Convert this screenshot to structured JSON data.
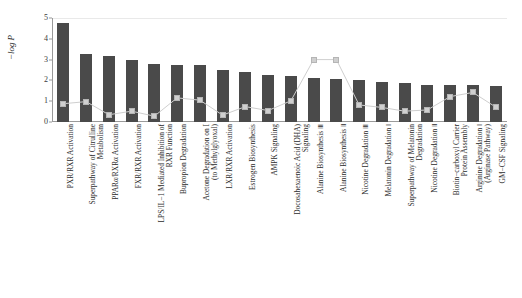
{
  "chart_data": {
    "type": "bar",
    "title": "",
    "xlabel": "",
    "ylabel": "−log P",
    "ylim": [
      0,
      5
    ],
    "yticks": [
      0,
      1,
      2,
      3,
      4,
      5
    ],
    "grid": false,
    "legend": "none",
    "bar_color": "#4a4a4a",
    "line_color": "#cfcfcf",
    "categories": [
      "PXR/RXR Activation",
      "Superpathway of Citrulline Metabolism",
      "PPARα/RXRα Activation",
      "FXR/RXR Activation",
      "LPS/IL−1 Mediated Inhibition of RXR Function",
      "Bupropion Degradation",
      "Acetone Degradation on I (to Methylglyoxal)",
      "LXR/RXR Activation",
      "Estrogen Biosynthesis",
      "AMPK Signaling",
      "Docosahexaenoic Acid (DHA) Signaling",
      "Alanine Biosynthesis Ⅲ",
      "Alanine Biosynthesis Ⅱ",
      "Nicotine Degradation Ⅲ",
      "Melatonin Degradation Ⅰ",
      "Superpathway of Melatonin Degradation",
      "Nicotine Degradation Ⅱ",
      "Biotin−carboxyl Carrier Protein Assembly",
      "Arginine Degradation Ⅰ (Arginase Pathway)",
      "GM−CSF Signaling"
    ],
    "category_lines": [
      [
        "PXR/RXR Activation"
      ],
      [
        "Superpathway of Citrulline",
        "Metabolism"
      ],
      [
        "PPARα/RXRα Activation"
      ],
      [
        "FXR/RXR Activation"
      ],
      [
        "LPS/IL−1 Mediated Inhibition of",
        "RXR Function"
      ],
      [
        "Bupropion Degradation"
      ],
      [
        "Acetone Degradation on I",
        "(to Methylglyoxal)"
      ],
      [
        "LXR/RXR Activation"
      ],
      [
        "Estrogen Biosynthesis"
      ],
      [
        "AMPK Signaling"
      ],
      [
        "Docosahexaenoic Acid (DHA)",
        "Signaling"
      ],
      [
        "Alanine Biosynthesis Ⅲ"
      ],
      [
        "Alanine Biosynthesis Ⅱ"
      ],
      [
        "Nicotine Degradation Ⅲ"
      ],
      [
        "Melatonin Degradation Ⅰ"
      ],
      [
        "Superpathway of Melatonin",
        "Degradation"
      ],
      [
        "Nicotine Degradation Ⅱ"
      ],
      [
        "Biotin−carboxyl Carrier",
        "Protein Assembly"
      ],
      [
        "Arginine Degradation Ⅰ",
        "(Arginase Pathway)"
      ],
      [
        "GM−CSF Signaling"
      ]
    ],
    "values": [
      4.75,
      3.28,
      3.15,
      2.97,
      2.78,
      2.76,
      2.72,
      2.5,
      2.4,
      2.26,
      2.22,
      2.12,
      2.08,
      2.03,
      1.93,
      1.86,
      1.8,
      1.78,
      1.76,
      1.74
    ],
    "series": [
      {
        "name": "bars",
        "type": "bar",
        "values": [
          4.75,
          3.28,
          3.15,
          2.97,
          2.78,
          2.76,
          2.72,
          2.5,
          2.4,
          2.26,
          2.22,
          2.12,
          2.08,
          2.03,
          1.93,
          1.86,
          1.8,
          1.78,
          1.76,
          1.74
        ]
      },
      {
        "name": "ratio-line",
        "type": "line",
        "values": [
          0.88,
          0.98,
          0.35,
          0.52,
          0.28,
          1.16,
          1.05,
          0.33,
          0.74,
          0.55,
          1.02,
          3.0,
          3.0,
          0.82,
          0.7,
          0.52,
          0.58,
          1.22,
          1.42,
          0.72
        ]
      }
    ]
  }
}
